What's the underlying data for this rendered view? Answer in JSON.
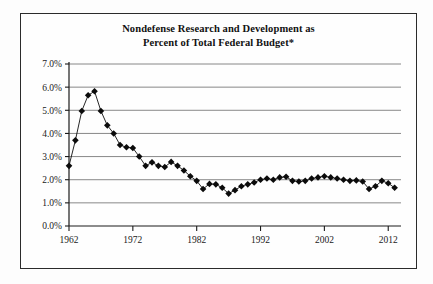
{
  "figure": {
    "title_line1": "Nondefense Research and Development as",
    "title_line2": "Percent of Total Federal Budget*",
    "frame_color": "#2b2b2b",
    "background_color": "#fefefe",
    "gridline_color": "#7a7a7a",
    "series_color": "#0b0b0b"
  },
  "chart_data": {
    "type": "line",
    "title": "Nondefense Research and Development as Percent of Total Federal Budget*",
    "xlabel": "",
    "ylabel": "",
    "xlim": [
      1962,
      2014
    ],
    "ylim": [
      0.0,
      7.0
    ],
    "yticks": [
      0.0,
      1.0,
      2.0,
      3.0,
      4.0,
      5.0,
      6.0,
      7.0
    ],
    "ytick_labels": [
      "0.0%",
      "1.0%",
      "2.0%",
      "3.0%",
      "4.0%",
      "5.0%",
      "6.0%",
      "7.0%"
    ],
    "xticks": [
      1962,
      1972,
      1982,
      1992,
      2002,
      2012
    ],
    "xtick_labels": [
      "1962",
      "1972",
      "1982",
      "1992",
      "2002",
      "2012"
    ],
    "grid": true,
    "legend": false,
    "marker": "diamond",
    "units": "percent",
    "x": [
      1962,
      1963,
      1964,
      1965,
      1966,
      1967,
      1968,
      1969,
      1970,
      1971,
      1972,
      1973,
      1974,
      1975,
      1976,
      1977,
      1978,
      1979,
      1980,
      1981,
      1982,
      1983,
      1984,
      1985,
      1986,
      1987,
      1988,
      1989,
      1990,
      1991,
      1992,
      1993,
      1994,
      1995,
      1996,
      1997,
      1998,
      1999,
      2000,
      2001,
      2002,
      2003,
      2004,
      2005,
      2006,
      2007,
      2008,
      2009,
      2010,
      2011,
      2012,
      2013
    ],
    "values": [
      2.6,
      3.7,
      4.97,
      5.65,
      5.82,
      4.97,
      4.35,
      4.0,
      3.5,
      3.4,
      3.37,
      3.0,
      2.6,
      2.75,
      2.6,
      2.55,
      2.77,
      2.6,
      2.4,
      2.15,
      1.95,
      1.6,
      1.82,
      1.8,
      1.65,
      1.4,
      1.55,
      1.72,
      1.8,
      1.88,
      2.0,
      2.05,
      2.0,
      2.1,
      2.13,
      1.95,
      1.92,
      1.95,
      2.05,
      2.1,
      2.15,
      2.1,
      2.05,
      2.0,
      1.95,
      1.97,
      1.92,
      1.6,
      1.72,
      1.95,
      1.85,
      1.65
    ],
    "series": [
      {
        "name": "Nondefense R&D as % of Total Federal Budget",
        "values": [
          2.6,
          3.7,
          4.97,
          5.65,
          5.82,
          4.97,
          4.35,
          4.0,
          3.5,
          3.4,
          3.37,
          3.0,
          2.6,
          2.75,
          2.6,
          2.55,
          2.77,
          2.6,
          2.4,
          2.15,
          1.95,
          1.6,
          1.82,
          1.8,
          1.65,
          1.4,
          1.55,
          1.72,
          1.8,
          1.88,
          2.0,
          2.05,
          2.0,
          2.1,
          2.13,
          1.95,
          1.92,
          1.95,
          2.05,
          2.1,
          2.15,
          2.1,
          2.05,
          2.0,
          1.95,
          1.97,
          1.92,
          1.6,
          1.72,
          1.95,
          1.85,
          1.65
        ]
      }
    ],
    "annotations": {
      "peak_year": 1966,
      "peak_value": 5.82,
      "trough_year": 1987,
      "trough_value": 1.4
    }
  }
}
